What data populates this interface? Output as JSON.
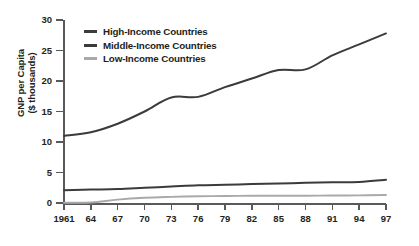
{
  "chart_data": {
    "type": "line",
    "title": "",
    "subtitle": "",
    "xlabel": "",
    "ylabel": "GNP per Capita ($ thousands)",
    "ylabel_line1": "GNP per Capita",
    "ylabel_line2": "($ thousands)",
    "grid": false,
    "legend_position": "top-left",
    "xlim": [
      1961,
      1997
    ],
    "ylim": [
      0,
      30
    ],
    "yticks": [
      0,
      5,
      10,
      15,
      20,
      25,
      30
    ],
    "ytick_labels": [
      "0",
      "5",
      "10",
      "15",
      "20",
      "25",
      "30"
    ],
    "xticks": [
      1961,
      1964,
      1967,
      1970,
      1973,
      1976,
      1979,
      1982,
      1985,
      1988,
      1991,
      1994,
      1997
    ],
    "xtick_labels": [
      "1961",
      "64",
      "67",
      "70",
      "73",
      "76",
      "79",
      "82",
      "85",
      "88",
      "91",
      "94",
      "97"
    ],
    "x": [
      1961,
      1964,
      1967,
      1970,
      1973,
      1976,
      1979,
      1982,
      1985,
      1988,
      1991,
      1994,
      1997
    ],
    "series": [
      {
        "name": "High-Income Countries",
        "color": "#3b3a3c",
        "values": [
          11.0,
          11.6,
          13.0,
          15.0,
          17.3,
          17.4,
          19.0,
          20.4,
          21.8,
          21.9,
          24.2,
          26.0,
          27.8
        ]
      },
      {
        "name": "Middle-Income Countries",
        "color": "#3b3a3c",
        "values": [
          2.1,
          2.2,
          2.3,
          2.5,
          2.7,
          2.9,
          3.0,
          3.1,
          3.2,
          3.3,
          3.4,
          3.45,
          3.8
        ]
      },
      {
        "name": "Low-Income Countries",
        "color": "#a7a9ac",
        "values": [
          0.05,
          0.08,
          0.55,
          0.85,
          1.0,
          1.1,
          1.15,
          1.18,
          1.2,
          1.2,
          1.22,
          1.25,
          1.3
        ]
      }
    ]
  },
  "legend": {
    "items": [
      {
        "label": "High-Income Countries",
        "color": "#3b3a3c"
      },
      {
        "label": "Middle-Income Countries",
        "color": "#3b3a3c"
      },
      {
        "label": "Low-Income Countries",
        "color": "#a7a9ac"
      }
    ]
  },
  "colors": {
    "axis": "#58595b",
    "text": "#231f20",
    "background": "#ffffff",
    "high_income": "#3b3a3c",
    "middle_income": "#3b3a3c",
    "low_income": "#a7a9ac"
  }
}
